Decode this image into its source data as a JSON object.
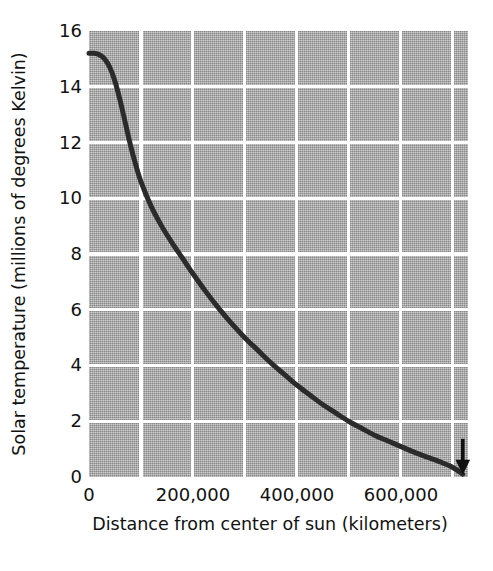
{
  "chart_data": {
    "type": "line",
    "title": "",
    "xlabel": "Distance from center of sun (kilometers)",
    "ylabel": "Solar temperature (millions of degrees Kelvin)",
    "xlim": [
      0,
      730000
    ],
    "ylim": [
      0,
      16
    ],
    "xticks": [
      0,
      200000,
      400000,
      600000
    ],
    "xtick_labels": [
      "0",
      "200,000",
      "400,000",
      "600,000"
    ],
    "yticks": [
      0,
      2,
      4,
      6,
      8,
      10,
      12,
      14,
      16
    ],
    "ytick_labels": [
      "0",
      "2",
      "4",
      "6",
      "8",
      "10",
      "12",
      "14",
      "16"
    ],
    "grid": true,
    "grid_color": "#ffffff",
    "plot_background": "#a9a9a9",
    "line_color": "#2b2b2b",
    "line_width": 5,
    "legend": null,
    "annotations": [
      {
        "name": "surface-arrow",
        "icon": "down-arrow-icon",
        "x": 720000,
        "y": 0.15,
        "label": ""
      }
    ],
    "series": [
      {
        "name": "Solar temperature",
        "x": [
          0,
          10000,
          20000,
          30000,
          40000,
          50000,
          60000,
          70000,
          80000,
          90000,
          100000,
          120000,
          140000,
          160000,
          180000,
          200000,
          225000,
          250000,
          275000,
          300000,
          325000,
          350000,
          375000,
          400000,
          425000,
          450000,
          475000,
          500000,
          525000,
          550000,
          575000,
          600000,
          625000,
          650000,
          675000,
          700000,
          720000
        ],
        "y": [
          15.2,
          15.2,
          15.15,
          15.0,
          14.7,
          14.2,
          13.5,
          12.7,
          11.9,
          11.2,
          10.6,
          9.7,
          9.0,
          8.4,
          7.85,
          7.3,
          6.65,
          6.05,
          5.5,
          5.0,
          4.55,
          4.1,
          3.7,
          3.3,
          2.95,
          2.6,
          2.3,
          2.0,
          1.75,
          1.5,
          1.3,
          1.1,
          0.9,
          0.72,
          0.55,
          0.35,
          0.1
        ]
      }
    ]
  }
}
